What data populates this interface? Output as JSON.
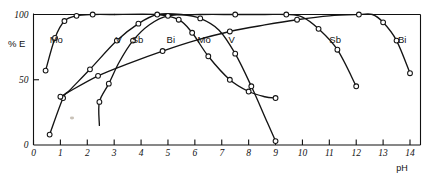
{
  "chart_data": {
    "type": "line",
    "title": "",
    "subtitle": "",
    "xlabel": "pH",
    "ylabel": "% E",
    "xlim": [
      0,
      14.6
    ],
    "ylim": [
      0,
      104
    ],
    "grid": false,
    "legend": "inline-curve-labels",
    "x_ticks": [
      "0",
      "1",
      "2",
      "3",
      "4",
      "5",
      "6",
      "7",
      "8",
      "9",
      "10",
      "11",
      "12",
      "13",
      "14"
    ],
    "y_ticks": [
      "0",
      "50",
      "100"
    ],
    "annotations": [
      {
        "text": "Mo",
        "x": 0.6,
        "y": 78
      },
      {
        "text": "V",
        "x": 3.05,
        "y": 78
      },
      {
        "text": "Sb",
        "x": 3.65,
        "y": 78
      },
      {
        "text": "Bi",
        "x": 4.95,
        "y": 78
      },
      {
        "text": "Mo",
        "x": 6.1,
        "y": 78
      },
      {
        "text": "V",
        "x": 7.25,
        "y": 78
      },
      {
        "text": "Sb",
        "x": 11.0,
        "y": 78
      },
      {
        "text": "Bi",
        "x": 13.55,
        "y": 78
      }
    ],
    "series": [
      {
        "name": "Mo-rise",
        "element": "Mo",
        "x": [
          0.45,
          0.8,
          1.15,
          1.6,
          2.2,
          3.0
        ],
        "values": [
          57,
          82,
          95,
          99,
          100,
          100
        ]
      },
      {
        "name": "Mo-fall",
        "element": "Mo",
        "x": [
          3.0,
          4.6,
          5.4,
          5.9,
          6.5,
          7.3,
          8.0,
          8.6,
          9.0
        ],
        "values": [
          100,
          100,
          96,
          86,
          68,
          50,
          41,
          37,
          36
        ]
      },
      {
        "name": "V",
        "element": "V",
        "x": [
          0.6,
          1.1,
          1.35,
          2.1,
          3.1,
          3.9,
          4.6,
          5.5,
          6.2,
          6.9,
          7.5,
          8.1,
          8.7,
          9.0
        ],
        "values": [
          8,
          36,
          42,
          58,
          80,
          93,
          100,
          100,
          97,
          88,
          70,
          45,
          17,
          3
        ]
      },
      {
        "name": "Sb",
        "element": "Sb",
        "x": [
          2.45,
          2.45,
          2.8,
          3.2,
          3.7,
          4.3,
          5.0,
          6.2,
          7.5,
          8.6,
          9.4,
          10.0,
          10.6,
          11.3,
          12.0
        ],
        "values": [
          15,
          33,
          47,
          64,
          80,
          92,
          99,
          100,
          100,
          100,
          100,
          98,
          89,
          73,
          45
        ]
      },
      {
        "name": "Bi",
        "element": "Bi",
        "x": [
          1.0,
          1.25,
          2.4,
          3.6,
          4.8,
          6.0,
          7.3,
          8.6,
          9.8,
          11.0,
          12.1,
          12.6,
          13.0,
          13.5,
          14.0
        ],
        "values": [
          37,
          40,
          53,
          63,
          72,
          80,
          87,
          92,
          96,
          99,
          100,
          100,
          94,
          80,
          55
        ]
      }
    ]
  }
}
